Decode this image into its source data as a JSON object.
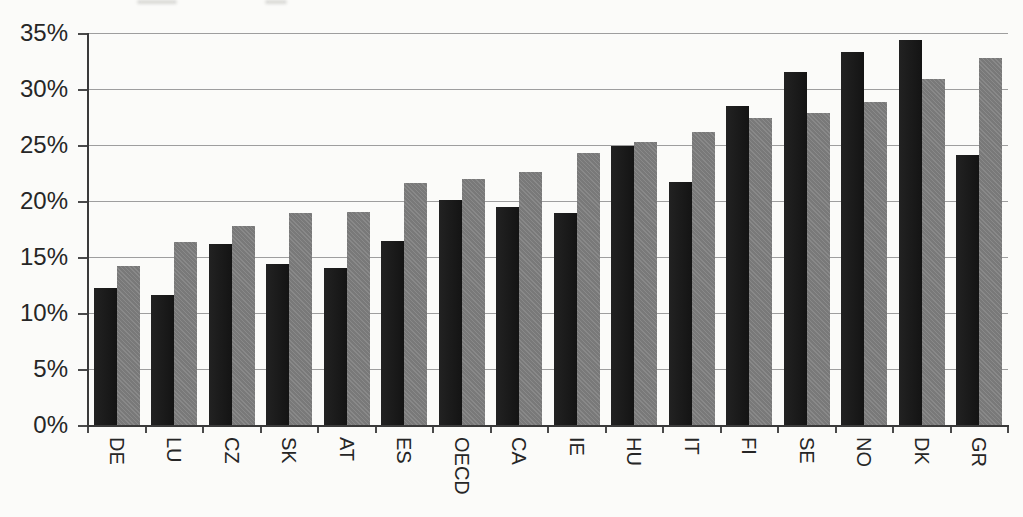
{
  "colors": {
    "background": "#fbfbf9",
    "bar_black": "#161616",
    "bar_gray": "#7f7f7f",
    "gridline": "#9e9e9e",
    "axis": "#3a3a3a",
    "label_text": "#262626"
  },
  "chart_data": {
    "type": "bar",
    "title": "",
    "xlabel": "",
    "ylabel": "",
    "legend_position": "none",
    "grid": true,
    "ylim": [
      0,
      35
    ],
    "y_tick_step": 5,
    "y_tick_labels": [
      "0%",
      "5%",
      "10%",
      "15%",
      "20%",
      "25%",
      "30%",
      "35%"
    ],
    "x_tick_label_rotation": 90,
    "categories": [
      "DE",
      "LU",
      "CZ",
      "SK",
      "AT",
      "ES",
      "OECD",
      "CA",
      "IE",
      "HU",
      "IT",
      "FI",
      "SE",
      "NO",
      "DK",
      "GR"
    ],
    "series": [
      {
        "name": "black",
        "color": "#161616",
        "values": [
          12.2,
          11.6,
          16.2,
          14.4,
          14.0,
          16.4,
          20.1,
          19.5,
          18.9,
          24.9,
          21.7,
          28.5,
          31.5,
          33.3,
          34.4,
          24.1
        ]
      },
      {
        "name": "gray",
        "color": "#7f7f7f",
        "values": [
          14.2,
          16.3,
          17.8,
          18.9,
          19.0,
          21.6,
          22.0,
          22.6,
          24.3,
          25.3,
          26.2,
          27.4,
          27.9,
          28.8,
          30.9,
          32.8
        ]
      }
    ]
  }
}
